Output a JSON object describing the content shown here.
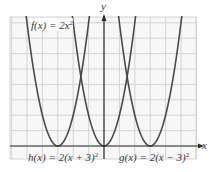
{
  "chart_data": {
    "type": "line",
    "title": "",
    "xlabel": "x",
    "ylabel": "y",
    "xlim": [
      -6,
      6
    ],
    "ylim": [
      -0.8,
      8.4
    ],
    "grid": true,
    "legend_position": "inline labels",
    "series": [
      {
        "name": "f(x) = 2x^2",
        "label_main": "f(x) = 2x",
        "label_sup": "2",
        "formula": "2*x^2",
        "vertex": [
          0,
          0
        ],
        "color": "#4a4a4a"
      },
      {
        "name": "h(x) = 2(x + 3)^2",
        "label_main": "h(x) = 2(x + 3)",
        "label_sup": "2",
        "formula": "2*(x+3)^2",
        "vertex": [
          -3,
          0
        ],
        "color": "#4a4a4a"
      },
      {
        "name": "g(x) = 2(x − 3)^2",
        "label_main": "g(x) = 2(x − 3)",
        "label_sup": "2",
        "formula": "2*(x-3)^2",
        "vertex": [
          3,
          0
        ],
        "color": "#4a4a4a"
      }
    ],
    "colors": {
      "grid": "#d4d4d4",
      "curve": "#4a4a4a",
      "axis": "#2a2a2a",
      "background": "#f7f7f7"
    }
  },
  "labels": {
    "x_axis": "x",
    "y_axis": "y",
    "f_main": "f(x) = 2x",
    "f_sup": "2",
    "h_main": "h(x) = 2(x + 3)",
    "h_sup": "2",
    "g_main": "g(x) = 2(x − 3)",
    "g_sup": "2"
  }
}
